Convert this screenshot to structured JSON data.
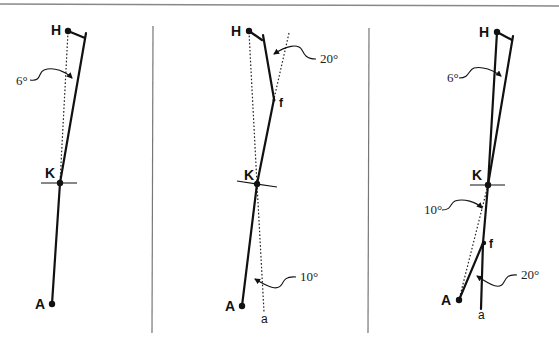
{
  "figure": {
    "panel_count": 3,
    "colors": {
      "ink": "#111111",
      "divider": "#777777",
      "top_border": "#888888",
      "background": "#ffffff"
    }
  },
  "panels": [
    {
      "id": "panel-1",
      "labels": {
        "hip": "H",
        "knee": "K",
        "ankle": "A"
      },
      "angles": [
        {
          "value": "6°",
          "description": "thigh angle from vertical reference"
        }
      ]
    },
    {
      "id": "panel-2",
      "labels": {
        "hip": "H",
        "knee": "K",
        "ankle": "A",
        "fracture": "f",
        "axis": "a"
      },
      "angles": [
        {
          "value": "20°",
          "description": "femoral angulation at fracture"
        },
        {
          "value": "10°",
          "description": "tibial angle from axis"
        }
      ]
    },
    {
      "id": "panel-3",
      "labels": {
        "hip": "H",
        "knee": "K",
        "ankle": "A",
        "fracture": "f",
        "axis": "a"
      },
      "angles": [
        {
          "value": "6°",
          "description": "thigh angle"
        },
        {
          "value": "10°",
          "description": "tibial angle"
        },
        {
          "value": "20°",
          "description": "tibial angulation at fracture"
        }
      ]
    }
  ]
}
